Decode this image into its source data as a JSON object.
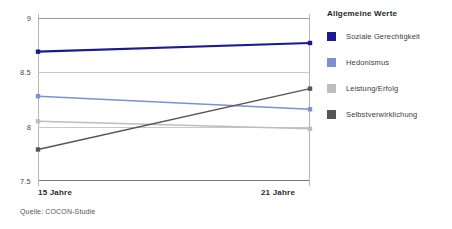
{
  "chart_data": {
    "type": "line",
    "title": "",
    "xlabel": "",
    "ylabel": "",
    "x": [
      "15 Jahre",
      "21 Jahre"
    ],
    "categories": [
      "15 Jahre",
      "21 Jahre"
    ],
    "ylim": [
      7.5,
      9.0
    ],
    "yticks": [
      "9",
      "8.5",
      "8",
      "7.5"
    ],
    "ytick_values": [
      9,
      8.5,
      8,
      7.5
    ],
    "grid": true,
    "legend_position": "right",
    "legend_title": "Allgemeine Werte",
    "series": [
      {
        "name": "Soziale Gerechtigkeit",
        "values": [
          8.69,
          8.77
        ],
        "color": "#1b1b8f"
      },
      {
        "name": "Hedonismus",
        "values": [
          8.28,
          8.16
        ],
        "color": "#7d8fd6"
      },
      {
        "name": "Leistung/Erfolg",
        "values": [
          8.05,
          7.98
        ],
        "color": "#bdbdbd"
      },
      {
        "name": "Selbstverwirklichung",
        "values": [
          7.79,
          8.35
        ],
        "color": "#555555"
      }
    ],
    "source": "Quelle: COCON-Studie"
  },
  "legend": {
    "title": "Allgemeine Werte",
    "items": [
      {
        "label": "Soziale Gerechtigkeit",
        "color": "#1b1b8f"
      },
      {
        "label": "Hedonismus",
        "color": "#7d8fd6"
      },
      {
        "label": "Leistung/Erfolg",
        "color": "#bdbdbd"
      },
      {
        "label": "Selbstverwirklichung",
        "color": "#555555"
      }
    ]
  },
  "axis": {
    "x_left_label": "15 Jahre",
    "x_right_label": "21 Jahre"
  },
  "footer": {
    "source": "Quelle: COCON-Studie"
  }
}
